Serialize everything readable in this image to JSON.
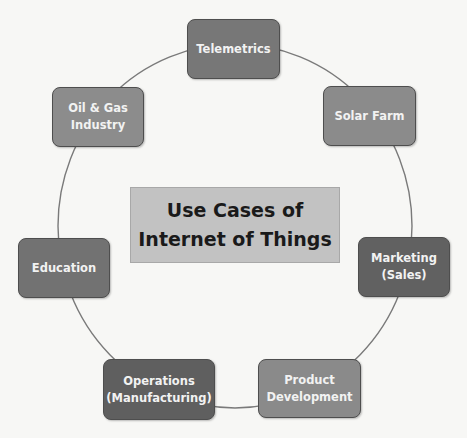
{
  "diagram": {
    "title": "Use Cases of\nInternet of Things",
    "center_color": "#c2c2c2",
    "ring_color": "#7a7a7a",
    "nodes": [
      {
        "label": "Telemetrics",
        "color": "#777777"
      },
      {
        "label": "Solar Farm",
        "color": "#8b8b8b"
      },
      {
        "label": "Marketing\n(Sales)",
        "color": "#616161"
      },
      {
        "label": "Product\nDevelopment",
        "color": "#8a8a8a"
      },
      {
        "label": "Operations\n(Manufacturing)",
        "color": "#5f5f5f"
      },
      {
        "label": "Education",
        "color": "#727272"
      },
      {
        "label": "Oil & Gas\nIndustry",
        "color": "#8c8c8c"
      }
    ]
  }
}
